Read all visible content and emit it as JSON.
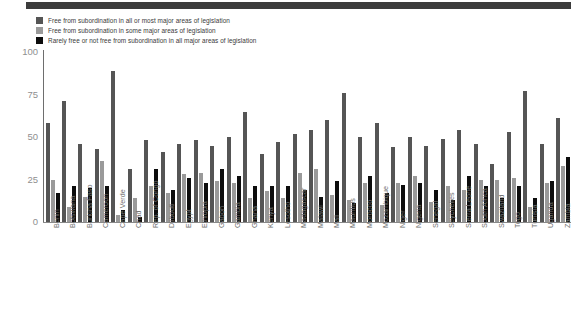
{
  "colors": {
    "series1": "#555555",
    "series2": "#9a9a9a",
    "series3": "#0d0d0d",
    "axis": "#8a8a8a",
    "tick_text": "#8f8f8f",
    "label_text": "#6d6d6d",
    "legend_text": "#3a3a3a",
    "top_bar": "#3c3c3c",
    "background": "#ffffff"
  },
  "legend": {
    "position": "top-left",
    "items": [
      {
        "label": "Free from subordination in all or most major areas of legislation",
        "color": "#555555"
      },
      {
        "label": "Free from subordination in some major areas of legislation",
        "color": "#9a9a9a"
      },
      {
        "label": "Rarely free or not free from subordination in all major areas of legislation",
        "color": "#0d0d0d"
      }
    ]
  },
  "chart_data": {
    "type": "bar",
    "title": "",
    "subtitle": "",
    "xlabel": "",
    "ylabel": "",
    "ylim": [
      0,
      100
    ],
    "yticks": [
      0,
      25,
      50,
      75,
      100
    ],
    "ytick_labels": [
      "0",
      "25",
      "50",
      "75",
      "100"
    ],
    "grid": false,
    "legend_position": "top-left",
    "orientation": "vertical",
    "grouped": true,
    "categories": [
      "Benin",
      "Botswana",
      "Burkina Faso",
      "Cameroon",
      "Cape Verde",
      "Chad",
      "Rep. of Congo",
      "Djibouti",
      "Egypt",
      "Ethiopia",
      "Gabon",
      "Gambia",
      "Ghana",
      "Kenya",
      "Lesotho",
      "Madagascar",
      "Malawi",
      "Mali",
      "Mauritius",
      "Morocco",
      "Mozambique",
      "Niger",
      "Nigeria",
      "Senegal",
      "Seychelles",
      "Sierra Leone",
      "South Africa",
      "Swaziland",
      "Togo",
      "Tunisia",
      "Uganda",
      "Zambia"
    ],
    "series": [
      {
        "name": "Free from subordination in all or most major areas of legislation",
        "color": "#555555",
        "values": [
          58,
          71,
          46,
          43,
          89,
          31,
          48,
          41,
          46,
          48,
          45,
          50,
          65,
          40,
          47,
          52,
          54,
          60,
          76,
          50,
          58,
          44,
          50,
          45,
          49,
          54,
          46,
          34,
          53,
          77,
          46,
          61
        ]
      },
      {
        "name": "Free from subordination in some major areas of legislation",
        "color": "#9a9a9a",
        "values": [
          25,
          9,
          15,
          36,
          4,
          14,
          21,
          17,
          28,
          29,
          24,
          23,
          14,
          18,
          14,
          29,
          31,
          16,
          13,
          23,
          10,
          23,
          27,
          12,
          21,
          19,
          25,
          25,
          26,
          9,
          23,
          33
        ]
      },
      {
        "name": "Rarely free or not free from subordination in all major areas of legislation",
        "color": "#0d0d0d",
        "values": [
          17,
          21,
          20,
          21,
          7,
          3,
          31,
          19,
          26,
          23,
          31,
          27,
          21,
          21,
          21,
          19,
          15,
          24,
          11,
          27,
          17,
          22,
          23,
          19,
          13,
          27,
          21,
          14,
          21,
          14,
          24,
          38
        ]
      }
    ]
  }
}
